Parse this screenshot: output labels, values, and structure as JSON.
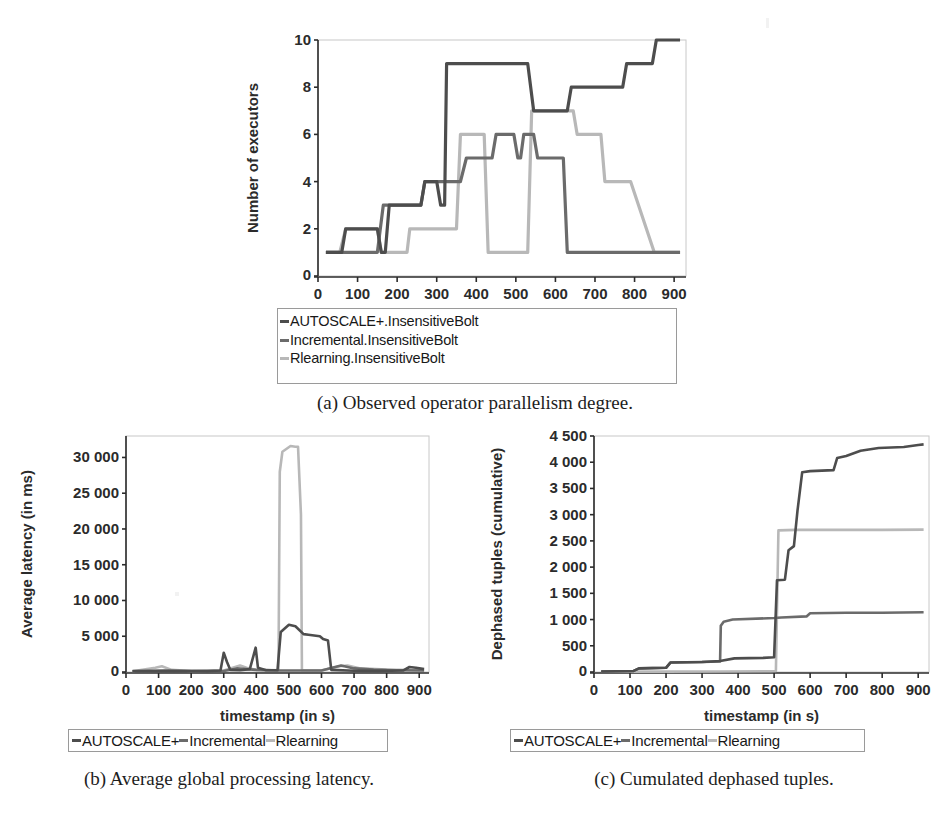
{
  "page": {
    "background": "#ffffff",
    "width": 951,
    "height": 840
  },
  "colors": {
    "autoscale": "#4d4d4d",
    "incremental": "#6b6b6b",
    "rlearning": "#b8b8b8",
    "axis": "#2b2b2b",
    "plot_border": "#c8c8c8"
  },
  "figures": [
    {
      "id": "a",
      "caption": "(a) Observed operator parallelism degree.",
      "legend": {
        "orientation": "vertical",
        "entries": [
          {
            "label": "AUTOSCALE+.InsensitiveBolt",
            "color": "#4d4d4d"
          },
          {
            "label": "Incremental.InsensitiveBolt",
            "color": "#6b6b6b"
          },
          {
            "label": "Rlearning.InsensitiveBolt",
            "color": "#b8b8b8"
          }
        ]
      },
      "chart_data": {
        "type": "line",
        "title": "",
        "xlabel": "timestamp (in s)",
        "ylabel": "Number of executors",
        "xlim": [
          0,
          930
        ],
        "ylim": [
          0,
          10
        ],
        "xticks": [
          0,
          100,
          200,
          300,
          400,
          500,
          600,
          700,
          800,
          900
        ],
        "yticks": [
          0,
          2,
          4,
          6,
          8,
          10
        ],
        "grid": false,
        "legend_position": "below",
        "series": [
          {
            "name": "AUTOSCALE+.InsensitiveBolt",
            "color": "#4d4d4d",
            "points": [
              [
                20,
                1
              ],
              [
                60,
                1
              ],
              [
                70,
                2
              ],
              [
                100,
                2
              ],
              [
                150,
                2
              ],
              [
                160,
                1
              ],
              [
                170,
                1
              ],
              [
                180,
                3
              ],
              [
                260,
                3
              ],
              [
                270,
                4
              ],
              [
                300,
                4
              ],
              [
                310,
                3
              ],
              [
                320,
                3
              ],
              [
                325,
                9
              ],
              [
                340,
                9
              ],
              [
                530,
                9
              ],
              [
                545,
                7
              ],
              [
                560,
                7
              ],
              [
                630,
                7
              ],
              [
                640,
                8
              ],
              [
                770,
                8
              ],
              [
                780,
                9
              ],
              [
                845,
                9
              ],
              [
                855,
                10
              ],
              [
                915,
                10
              ]
            ]
          },
          {
            "name": "Incremental.InsensitiveBolt",
            "color": "#6b6b6b",
            "points": [
              [
                20,
                1
              ],
              [
                150,
                1
              ],
              [
                165,
                3
              ],
              [
                260,
                3
              ],
              [
                270,
                4
              ],
              [
                360,
                4
              ],
              [
                375,
                5
              ],
              [
                440,
                5
              ],
              [
                450,
                6
              ],
              [
                495,
                6
              ],
              [
                505,
                5
              ],
              [
                512,
                5
              ],
              [
                520,
                6
              ],
              [
                545,
                6
              ],
              [
                555,
                5
              ],
              [
                620,
                5
              ],
              [
                630,
                1
              ],
              [
                915,
                1
              ]
            ]
          },
          {
            "name": "Rlearning.InsensitiveBolt",
            "color": "#b8b8b8",
            "points": [
              [
                20,
                1
              ],
              [
                55,
                1
              ],
              [
                70,
                2
              ],
              [
                150,
                2
              ],
              [
                160,
                1
              ],
              [
                225,
                1
              ],
              [
                232,
                2
              ],
              [
                350,
                2
              ],
              [
                360,
                6
              ],
              [
                420,
                6
              ],
              [
                430,
                1
              ],
              [
                530,
                1
              ],
              [
                540,
                7
              ],
              [
                645,
                7
              ],
              [
                655,
                6
              ],
              [
                715,
                6
              ],
              [
                725,
                4
              ],
              [
                790,
                4
              ],
              [
                850,
                1
              ],
              [
                915,
                1
              ]
            ]
          }
        ]
      }
    },
    {
      "id": "b",
      "caption": "(b) Average global processing latency.",
      "legend": {
        "orientation": "horizontal",
        "entries": [
          {
            "label": "AUTOSCALE+",
            "color": "#4d4d4d"
          },
          {
            "label": "Incremental",
            "color": "#6b6b6b"
          },
          {
            "label": "Rlearning",
            "color": "#b8b8b8"
          }
        ]
      },
      "chart_data": {
        "type": "line",
        "title": "",
        "xlabel": "timestamp (in s)",
        "ylabel": "Average latency (in ms)",
        "xlim": [
          0,
          930
        ],
        "ylim": [
          0,
          33000
        ],
        "xticks": [
          0,
          100,
          200,
          300,
          400,
          500,
          600,
          700,
          800,
          900
        ],
        "yticks": [
          0,
          5000,
          10000,
          15000,
          20000,
          25000,
          30000
        ],
        "ytick_labels": [
          "0",
          "5 000",
          "10 000",
          "15 000",
          "20 000",
          "25 000",
          "30 000"
        ],
        "grid": false,
        "legend_position": "below",
        "series": [
          {
            "name": "AUTOSCALE+",
            "color": "#4d4d4d",
            "points": [
              [
                20,
                120
              ],
              [
                100,
                150
              ],
              [
                180,
                120
              ],
              [
                250,
                120
              ],
              [
                290,
                200
              ],
              [
                300,
                2700
              ],
              [
                310,
                1400
              ],
              [
                320,
                300
              ],
              [
                350,
                250
              ],
              [
                380,
                400
              ],
              [
                398,
                3400
              ],
              [
                405,
                600
              ],
              [
                430,
                250
              ],
              [
                465,
                250
              ],
              [
                475,
                5600
              ],
              [
                500,
                6600
              ],
              [
                520,
                6400
              ],
              [
                545,
                5300
              ],
              [
                560,
                5200
              ],
              [
                595,
                5000
              ],
              [
                605,
                4600
              ],
              [
                620,
                4400
              ],
              [
                630,
                300
              ],
              [
                700,
                180
              ],
              [
                780,
                160
              ],
              [
                850,
                200
              ],
              [
                870,
                700
              ],
              [
                890,
                600
              ],
              [
                915,
                400
              ]
            ]
          },
          {
            "name": "Incremental",
            "color": "#6b6b6b",
            "points": [
              [
                20,
                100
              ],
              [
                120,
                200
              ],
              [
                200,
                120
              ],
              [
                300,
                150
              ],
              [
                340,
                500
              ],
              [
                400,
                300
              ],
              [
                470,
                200
              ],
              [
                540,
                220
              ],
              [
                600,
                200
              ],
              [
                660,
                900
              ],
              [
                700,
                500
              ],
              [
                760,
                350
              ],
              [
                830,
                250
              ],
              [
                915,
                200
              ]
            ]
          },
          {
            "name": "Rlearning",
            "color": "#b8b8b8",
            "points": [
              [
                20,
                100
              ],
              [
                90,
                600
              ],
              [
                110,
                800
              ],
              [
                140,
                300
              ],
              [
                200,
                150
              ],
              [
                300,
                200
              ],
              [
                350,
                900
              ],
              [
                370,
                600
              ],
              [
                400,
                300
              ],
              [
                468,
                250
              ],
              [
                472,
                28000
              ],
              [
                480,
                30800
              ],
              [
                505,
                31600
              ],
              [
                520,
                31500
              ],
              [
                528,
                31500
              ],
              [
                537,
                22000
              ],
              [
                540,
                250
              ],
              [
                600,
                200
              ],
              [
                655,
                800
              ],
              [
                680,
                900
              ],
              [
                720,
                500
              ],
              [
                800,
                350
              ],
              [
                915,
                250
              ]
            ]
          }
        ]
      }
    },
    {
      "id": "c",
      "caption": "(c) Cumulated dephased tuples.",
      "legend": {
        "orientation": "horizontal",
        "entries": [
          {
            "label": "AUTOSCALE+",
            "color": "#4d4d4d"
          },
          {
            "label": "Incremental",
            "color": "#6b6b6b"
          },
          {
            "label": "Rlearning",
            "color": "#b8b8b8"
          }
        ]
      },
      "chart_data": {
        "type": "line",
        "title": "",
        "xlabel": "timestamp (in s)",
        "ylabel": "Dephased tuples (cumulative)",
        "xlim": [
          0,
          930
        ],
        "ylim": [
          0,
          4500
        ],
        "xticks": [
          0,
          100,
          200,
          300,
          400,
          500,
          600,
          700,
          800,
          900
        ],
        "yticks": [
          0,
          500,
          1000,
          1500,
          2000,
          2500,
          3000,
          3500,
          4000,
          4500
        ],
        "ytick_labels": [
          "0",
          "500",
          "1 000",
          "1 500",
          "2 000",
          "2 500",
          "3 000",
          "3 500",
          "4 000",
          "4 500"
        ],
        "grid": false,
        "legend_position": "below",
        "series": [
          {
            "name": "AUTOSCALE+",
            "color": "#4d4d4d",
            "points": [
              [
                20,
                10
              ],
              [
                110,
                20
              ],
              [
                125,
                70
              ],
              [
                200,
                80
              ],
              [
                212,
                180
              ],
              [
                300,
                190
              ],
              [
                350,
                210
              ],
              [
                390,
                260
              ],
              [
                470,
                270
              ],
              [
                500,
                280
              ],
              [
                508,
                1750
              ],
              [
                530,
                1760
              ],
              [
                540,
                2320
              ],
              [
                555,
                2400
              ],
              [
                565,
                3080
              ],
              [
                578,
                3810
              ],
              [
                600,
                3830
              ],
              [
                665,
                3850
              ],
              [
                675,
                4080
              ],
              [
                700,
                4120
              ],
              [
                740,
                4220
              ],
              [
                790,
                4270
              ],
              [
                860,
                4290
              ],
              [
                900,
                4330
              ],
              [
                915,
                4340
              ]
            ]
          },
          {
            "name": "Incremental",
            "color": "#6b6b6b",
            "points": [
              [
                20,
                10
              ],
              [
                110,
                20
              ],
              [
                125,
                70
              ],
              [
                200,
                80
              ],
              [
                212,
                180
              ],
              [
                300,
                190
              ],
              [
                350,
                200
              ],
              [
                352,
                880
              ],
              [
                360,
                960
              ],
              [
                385,
                1000
              ],
              [
                500,
                1030
              ],
              [
                520,
                1040
              ],
              [
                590,
                1060
              ],
              [
                600,
                1120
              ],
              [
                700,
                1130
              ],
              [
                800,
                1130
              ],
              [
                915,
                1140
              ]
            ]
          },
          {
            "name": "Rlearning",
            "color": "#b8b8b8",
            "points": [
              [
                20,
                5
              ],
              [
                200,
                8
              ],
              [
                350,
                10
              ],
              [
                490,
                15
              ],
              [
                505,
                20
              ],
              [
                512,
                2700
              ],
              [
                560,
                2710
              ],
              [
                700,
                2710
              ],
              [
                800,
                2710
              ],
              [
                915,
                2715
              ]
            ]
          }
        ]
      }
    }
  ]
}
